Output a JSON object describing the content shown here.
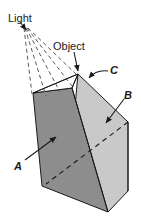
{
  "figure": {
    "background_color": "#ffffff",
    "width": 141,
    "height": 224,
    "labels": {
      "light": "Light",
      "object": "Object",
      "face_a": "A",
      "face_b": "B",
      "edge_c": "C"
    },
    "colors": {
      "dark_face": "#8d8d8d",
      "light_face": "#c9c9c9",
      "top_face": "#ffffff",
      "outline": "#1a1a1a",
      "ray": "#5a5a5a",
      "label_text": "#1a1a1a"
    },
    "geometry": {
      "light_source": {
        "x": 24,
        "y": 28
      },
      "apex_object": {
        "x": 78,
        "y": 74
      },
      "front_top_left": {
        "x": 33,
        "y": 93
      },
      "front_bottom_left": {
        "x": 42,
        "y": 186
      },
      "front_bottom_right": {
        "x": 108,
        "y": 212
      },
      "right_top": {
        "x": 128,
        "y": 122
      },
      "right_bottom": {
        "x": 128,
        "y": 191
      },
      "mid_top": {
        "x": 72,
        "y": 88
      },
      "ray_count": 5
    }
  }
}
